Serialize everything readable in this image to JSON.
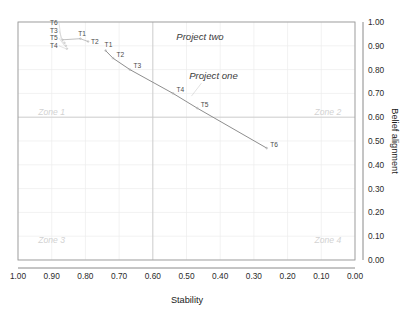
{
  "chart_data": {
    "type": "line",
    "title": "",
    "xlabel": "Stability",
    "ylabel": "Belief alignment",
    "xlim": [
      1.0,
      0.0
    ],
    "ylim": [
      0.0,
      1.0
    ],
    "x_axis_reversed": true,
    "y_axis_position": "right",
    "grid": true,
    "legend": "none",
    "xticks": [
      "1.00",
      "0.90",
      "0.80",
      "0.70",
      "0.60",
      "0.50",
      "0.40",
      "0.30",
      "0.20",
      "0.10",
      "0.00"
    ],
    "yticks": [
      "0.00",
      "0.10",
      "0.20",
      "0.30",
      "0.40",
      "0.50",
      "0.60",
      "0.70",
      "0.80",
      "0.90",
      "1.00"
    ],
    "reference_lines": [
      {
        "name": "vertical-reference",
        "axis": "x",
        "value": 0.6
      },
      {
        "name": "horizontal-reference",
        "axis": "y",
        "value": 0.6
      }
    ],
    "zones": [
      {
        "name": "zone-1",
        "label": "Zone 1",
        "x": 0.94,
        "y": 0.61
      },
      {
        "name": "zone-2",
        "label": "Zone 2",
        "x": 0.12,
        "y": 0.61
      },
      {
        "name": "zone-3",
        "label": "Zone 3",
        "x": 0.94,
        "y": 0.07
      },
      {
        "name": "zone-4",
        "label": "Zone 4",
        "x": 0.12,
        "y": 0.07
      }
    ],
    "series": [
      {
        "name": "Project one",
        "annotation": "Project one",
        "annotation_x": 0.42,
        "annotation_y": 0.76,
        "points": [
          {
            "label": "T1",
            "x": 0.74,
            "y": 0.88
          },
          {
            "label": "T2",
            "x": 0.718,
            "y": 0.848
          },
          {
            "label": "T3",
            "x": 0.668,
            "y": 0.8
          },
          {
            "label": "T4",
            "x": 0.54,
            "y": 0.7
          },
          {
            "label": "T5",
            "x": 0.468,
            "y": 0.638
          },
          {
            "label": "T6",
            "x": 0.262,
            "y": 0.47
          }
        ]
      },
      {
        "name": "Project two",
        "annotation": "Project two",
        "annotation_x": 0.46,
        "annotation_y": 0.925,
        "points": [
          {
            "label": "T6",
            "x": 0.868,
            "y": 0.925
          },
          {
            "label": "T3",
            "x": 0.862,
            "y": 0.912
          },
          {
            "label": "T5",
            "x": 0.858,
            "y": 0.9
          },
          {
            "label": "T4",
            "x": 0.855,
            "y": 0.888
          },
          {
            "label": "T1",
            "x": 0.815,
            "y": 0.93
          },
          {
            "label": "T2",
            "x": 0.792,
            "y": 0.918
          }
        ]
      }
    ]
  }
}
